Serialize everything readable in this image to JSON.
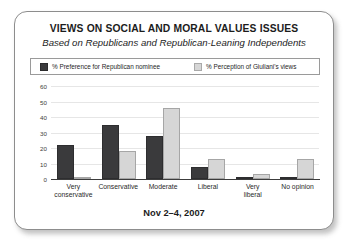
{
  "card": {
    "title": "VIEWS ON SOCIAL AND MORAL VALUES ISSUES",
    "subtitle": "Based on Republicans and Republican-Leaning Independents",
    "footer": "Nov 2–4, 2007"
  },
  "colors": {
    "series_dark": "#3a3a3c",
    "series_light": "#d6d6d6",
    "axis": "#3c3c3c",
    "grid": "#e6e6e6",
    "border": "#8d8d8d"
  },
  "chart_data": {
    "type": "bar",
    "title": "VIEWS ON SOCIAL AND MORAL VALUES ISSUES",
    "subtitle": "Based on Republicans and Republican-Leaning Independents",
    "xlabel": "",
    "ylabel": "",
    "ylim": [
      0,
      60
    ],
    "yticks": [
      0,
      10,
      20,
      30,
      40,
      50,
      60
    ],
    "grid": true,
    "legend_position": "top",
    "note": "Nov 2–4, 2007",
    "categories": [
      "Very conservative",
      "Conservative",
      "Moderate",
      "Liberal",
      "Very liberal",
      "No opinion"
    ],
    "category_lines": [
      [
        "Very",
        "conservative"
      ],
      [
        "Conservative"
      ],
      [
        "Moderate"
      ],
      [
        "Liberal"
      ],
      [
        "Very",
        "liberal"
      ],
      [
        "No opinion"
      ]
    ],
    "series": [
      {
        "name": "% Preference for Republican nominee",
        "color": "#3a3a3c",
        "values": [
          22,
          35,
          28,
          8,
          1,
          1
        ]
      },
      {
        "name": "% Perception of Giuliani's views",
        "color": "#d6d6d6",
        "values": [
          1,
          18,
          46,
          13,
          3,
          13
        ]
      }
    ]
  }
}
